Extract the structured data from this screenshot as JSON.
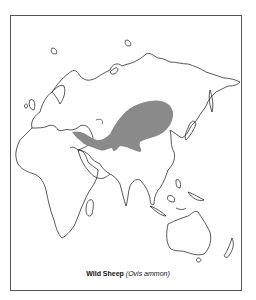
{
  "map": {
    "caption_common": "Wild Sheep",
    "caption_scientific": "(Ovis ammon)",
    "range_color": "#8a8a8a",
    "outline_color": "#111111",
    "projection_note": "",
    "regions_shown": [
      "Europe",
      "Asia",
      "Africa",
      "Australia",
      "New Zealand",
      "Indonesia",
      "Japan"
    ],
    "highlighted_range": "Central Asia (Turkey/Iran to Mongolia)"
  }
}
